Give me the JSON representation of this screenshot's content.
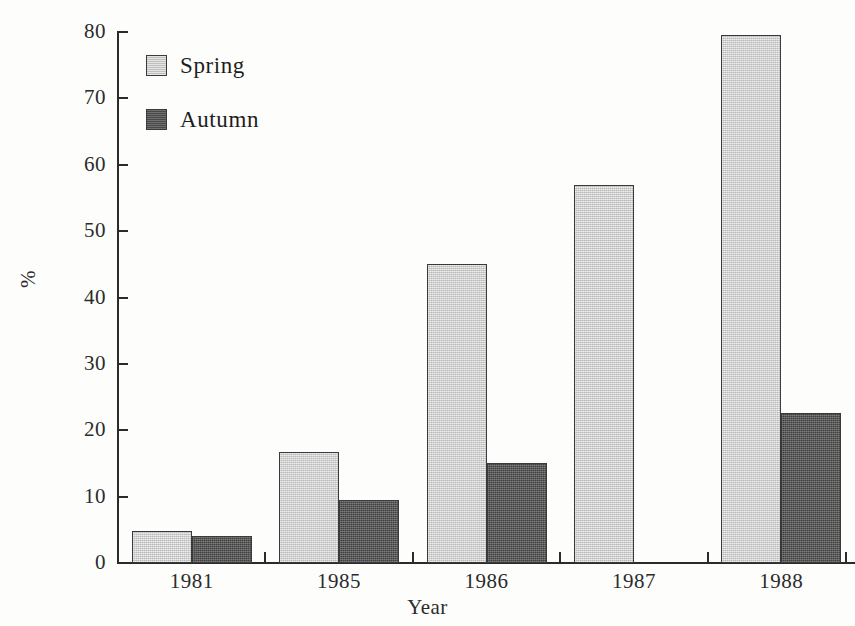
{
  "chart_data": {
    "type": "bar",
    "title": "",
    "xlabel": "Year",
    "ylabel": "%",
    "categories": [
      "1981",
      "1985",
      "1986",
      "1987",
      "1988"
    ],
    "series": [
      {
        "name": "Spring",
        "color": "#c9c9c9",
        "values": [
          4.8,
          16.7,
          45.0,
          57.0,
          79.5
        ]
      },
      {
        "name": "Autumn",
        "color": "#585858",
        "values": [
          4.1,
          9.5,
          15.0,
          null,
          22.6
        ]
      }
    ],
    "ylim": [
      0,
      80
    ],
    "ytick_labels": [
      "0",
      "10",
      "20",
      "30",
      "40",
      "50",
      "60",
      "70",
      "80"
    ],
    "ytick_values": [
      0,
      10,
      20,
      30,
      40,
      50,
      60,
      70,
      80
    ],
    "grid": false,
    "legend_position": "top-left"
  },
  "legend": {
    "entries": [
      {
        "label": "Spring"
      },
      {
        "label": "Autumn"
      }
    ]
  },
  "axes": {
    "x_title": "Year",
    "y_title": "%"
  }
}
